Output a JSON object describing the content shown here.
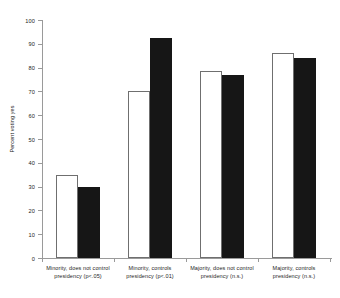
{
  "chart_data": {
    "type": "bar",
    "title": "",
    "xlabel": "",
    "ylabel": "Percent voting yes",
    "ylim": [
      0,
      100
    ],
    "yticks": [
      0,
      10,
      20,
      30,
      40,
      50,
      60,
      70,
      80,
      90,
      100
    ],
    "grid": false,
    "legend_position": "none",
    "categories": [
      "Minority, does not control presidency (p<.05)",
      "Minority, controls presidency (p<.01)",
      "Majority, does not control presidency (n.s.)",
      "Majority, controls presidency (n.s.)"
    ],
    "category_lines": [
      {
        "line1": "Minority, does not control",
        "line2": "presidency (p<.05)"
      },
      {
        "line1": "Minority, controls",
        "line2": "presidency (p<.01)"
      },
      {
        "line1": "Majority, does not control",
        "line2": "presidency (n.s.)"
      },
      {
        "line1": "Majority, controls",
        "line2": "presidency (n.s.)"
      }
    ],
    "series": [
      {
        "name": "open",
        "style": "white-outline",
        "color": "#ffffff",
        "values": [
          35,
          70,
          78.5,
          86
        ]
      },
      {
        "name": "filled",
        "style": "black-solid",
        "color": "#161616",
        "values": [
          30,
          92.5,
          77,
          84
        ]
      }
    ]
  },
  "axis": {
    "y_tick_labels": [
      "0",
      "10",
      "20",
      "30",
      "40",
      "50",
      "60",
      "70",
      "80",
      "90",
      "100"
    ],
    "y_axis_title": "Percent voting yes"
  }
}
